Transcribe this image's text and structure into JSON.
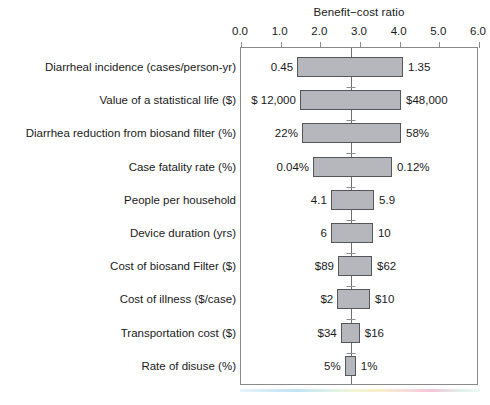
{
  "chart_data": {
    "type": "bar",
    "chart_variant": "tornado",
    "title": "Benefit−cost ratio",
    "xlabel": "Benefit−cost ratio",
    "ylabel": "",
    "xlim": [
      0.0,
      6.0
    ],
    "xticks": [
      "0.0",
      "1.0",
      "2.0",
      "3.0",
      "4.0",
      "5.0",
      "6.0"
    ],
    "xtick_values": [
      0.0,
      1.0,
      2.0,
      3.0,
      4.0,
      5.0,
      6.0
    ],
    "grid": false,
    "legend": "none",
    "baseline_value": 2.77,
    "categories": [
      "Diarrheal incidence (cases/person-yr)",
      "Value of a statistical life ($)",
      "Diarrhea reduction from biosand filter (%)",
      "Case fatality rate (%)",
      "People per household",
      "Device duration (yrs)",
      "Cost of biosand Filter ($)",
      "Cost of illness ($/case)",
      "Transportation cost ($)",
      "Rate of disuse (%)"
    ],
    "bars": [
      {
        "label": "Diarrheal incidence (cases/person-yr)",
        "low_label": "0.45",
        "high_label": "1.35",
        "low_ratio": 1.44,
        "high_ratio": 4.11
      },
      {
        "label": "Value of a statistical life ($)",
        "low_label": "$ 12,000",
        "high_label": "$48,000",
        "low_ratio": 1.51,
        "high_ratio": 4.06
      },
      {
        "label": "Diarrhea reduction from biosand filter (%)",
        "low_label": "22%",
        "high_label": "58%",
        "low_ratio": 1.56,
        "high_ratio": 4.06
      },
      {
        "label": "Case fatality rate (%)",
        "low_label": "0.04%",
        "high_label": "0.12%",
        "low_ratio": 1.84,
        "high_ratio": 3.83
      },
      {
        "label": "People per household",
        "low_label": "4.1",
        "high_label": "5.9",
        "low_ratio": 2.29,
        "high_ratio": 3.38
      },
      {
        "label": "Device duration (yrs)",
        "low_label": "6",
        "high_label": "10",
        "low_ratio": 2.29,
        "high_ratio": 3.35
      },
      {
        "label": "Cost of biosand Filter ($)",
        "low_label": "$89",
        "high_label": "$62",
        "low_ratio": 2.47,
        "high_ratio": 3.33
      },
      {
        "label": "Cost of illness ($/case)",
        "low_label": "$2",
        "high_label": "$10",
        "low_ratio": 2.45,
        "high_ratio": 3.28
      },
      {
        "label": "Transportation cost ($)",
        "low_label": "$34",
        "high_label": "$16",
        "low_ratio": 2.54,
        "high_ratio": 3.02
      },
      {
        "label": "Rate of disuse (%)",
        "low_label": "5%",
        "high_label": "1%",
        "low_ratio": 2.64,
        "high_ratio": 2.92
      }
    ],
    "colors": {
      "bar_fill": "#b6b6bd",
      "bar_border": "#55555c",
      "axis": "#8a8a8a",
      "baseline": "#6e6e74",
      "text": "#1a1a1a",
      "background": "#ffffff"
    }
  }
}
